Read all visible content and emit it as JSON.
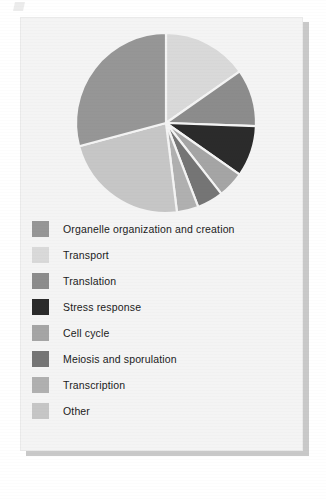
{
  "figure": {
    "panel_background": "#f4f4f4",
    "shadow_color": "#c9c9c9"
  },
  "chart_data": {
    "type": "pie",
    "title": "",
    "subtitle": "",
    "xlabel": "",
    "ylabel": "",
    "legend_position": "bottom-left",
    "grid": false,
    "start_angle_deg": 0,
    "direction": "clockwise",
    "center": {
      "cx": 145,
      "cy": 105
    },
    "radius": 90,
    "categories": [
      "Organelle organization and creation",
      "Transport",
      "Translation",
      "Stress response",
      "Cell cycle",
      "Meiosis and sporulation",
      "Transcription",
      "Other"
    ],
    "values": [
      29.2,
      15.3,
      10.3,
      9.2,
      4.7,
      4.7,
      3.9,
      22.7
    ],
    "angles_deg": [
      105,
      55,
      37,
      33,
      17,
      17,
      14,
      82
    ],
    "colors": [
      "#969696",
      "#d9d9d9",
      "#8c8c8c",
      "#2b2b2b",
      "#a5a5a5",
      "#757575",
      "#b0b0b0",
      "#c6c6c6"
    ],
    "slice_order_clockwise_from_top": [
      "Transport",
      "Translation",
      "Stress response",
      "Cell cycle",
      "Meiosis and sporulation",
      "Transcription",
      "Other",
      "Organelle organization and creation"
    ],
    "separator_color": "#f4f4f4"
  },
  "legend": {
    "items": [
      {
        "label": "Organelle organization and creation",
        "color": "#969696"
      },
      {
        "label": "Transport",
        "color": "#d9d9d9"
      },
      {
        "label": "Translation",
        "color": "#8c8c8c"
      },
      {
        "label": "Stress response",
        "color": "#2b2b2b"
      },
      {
        "label": "Cell cycle",
        "color": "#a5a5a5"
      },
      {
        "label": "Meiosis and sporulation",
        "color": "#757575"
      },
      {
        "label": "Transcription",
        "color": "#b0b0b0"
      },
      {
        "label": "Other",
        "color": "#c6c6c6"
      }
    ]
  }
}
